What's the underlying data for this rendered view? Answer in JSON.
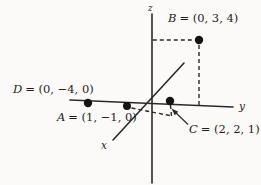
{
  "figure": {
    "ink_color": "#2a2a2a",
    "paper_color": "#fbfaf8",
    "axes": {
      "x_label": "x",
      "y_label": "y",
      "z_label": "z"
    },
    "points": [
      {
        "name": "B",
        "value": "= (0, 3, 4)"
      },
      {
        "name": "D",
        "value": "= (0, −4, 0)"
      },
      {
        "name": "A",
        "value": "= (1, −1, 0)"
      },
      {
        "name": "C",
        "value": "= (2, 2, 1)"
      }
    ]
  }
}
